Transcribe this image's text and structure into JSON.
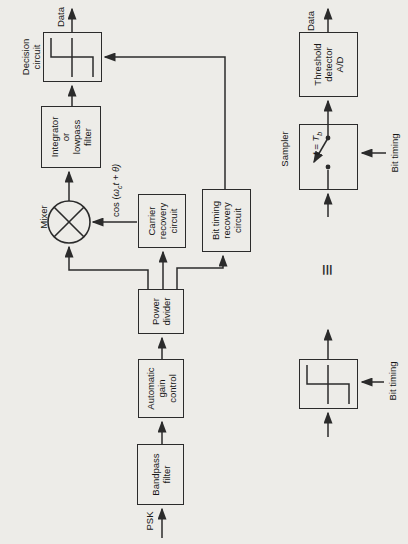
{
  "diagram": {
    "ink_color": "#2b2b2b",
    "paper_color": "#edece8",
    "receiver": {
      "input_label": "PSK",
      "bandpass_filter": [
        "Bandpass",
        "filter"
      ],
      "automatic_gain_control": [
        "Automatic",
        "gain",
        "control"
      ],
      "power_divider": [
        "Power",
        "divider"
      ],
      "mixer_label": "Mixer",
      "carrier_recovery": [
        "Carrier",
        "recovery",
        "circuit"
      ],
      "bit_timing_recovery": [
        "Bit timing",
        "recovery",
        "circuit"
      ],
      "carrier_signal": {
        "prefix": "cos (",
        "omega": "ω",
        "omega_sub": "c",
        "rest": "t + θ)"
      },
      "integrator": [
        "Integrator",
        "or",
        "lowpass",
        "filter"
      ],
      "decision_circuit_label": [
        "Decision",
        "circuit"
      ],
      "output_label": "Data"
    },
    "equivalence": {
      "symbol": "≡",
      "sampler_label": "Sampler",
      "sample_time": {
        "prefix": "t = T",
        "sub": "b"
      },
      "sampler_bit_timing_label": "Bit timing",
      "limiter_bit_timing_label": "Bit timing",
      "threshold_detector": [
        "Threshold",
        "detector",
        "A/D"
      ],
      "output_label": "Data"
    }
  }
}
